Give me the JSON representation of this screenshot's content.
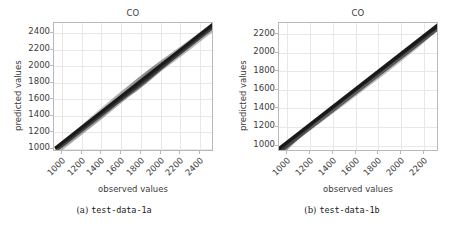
{
  "figure": {
    "panels": [
      {
        "id": "panel-a",
        "caption_index": "(a)",
        "caption_text": "test-data-1a",
        "chart_data": {
          "type": "scatter",
          "title": "CO",
          "xlabel": "observed values",
          "ylabel": "predicted values",
          "xticks": [
            1000,
            1200,
            1400,
            1600,
            1800,
            2000,
            2200,
            2400
          ],
          "yticks": [
            1000,
            1200,
            1400,
            1600,
            1800,
            2000,
            2200,
            2400
          ],
          "xlim": [
            920,
            2540
          ],
          "ylim": [
            960,
            2520
          ],
          "grid": true,
          "legend": null,
          "series": [
            {
              "name": "observed vs predicted",
              "color": "#1a1a1a",
              "description": "dense near-diagonal point cloud following y = x, widening into a gray fan between roughly x=1650 and x=2050",
              "x": [
                1040,
                1100,
                1160,
                1220,
                1280,
                1340,
                1400,
                1460,
                1520,
                1580,
                1640,
                1700,
                1760,
                1820,
                1880,
                1940,
                2000,
                2060,
                2120,
                2180,
                2240,
                2300,
                2360,
                2420,
                2480
              ],
              "y": [
                1060,
                1115,
                1170,
                1230,
                1290,
                1350,
                1410,
                1468,
                1528,
                1588,
                1650,
                1712,
                1775,
                1838,
                1898,
                1955,
                2012,
                2070,
                2130,
                2190,
                2250,
                2310,
                2368,
                2428,
                2490
              ],
              "spread_low": [
                1045,
                1098,
                1152,
                1208,
                1265,
                1322,
                1380,
                1436,
                1492,
                1546,
                1600,
                1652,
                1706,
                1760,
                1818,
                1878,
                1940,
                2002,
                2066,
                2130,
                2196,
                2260,
                2324,
                2388,
                2452
              ],
              "spread_high": [
                1075,
                1132,
                1190,
                1250,
                1312,
                1374,
                1436,
                1496,
                1556,
                1616,
                1678,
                1748,
                1820,
                1890,
                1952,
                2004,
                2052,
                2104,
                2158,
                2212,
                2268,
                2324,
                2382,
                2442,
                2502
              ]
            }
          ]
        }
      },
      {
        "id": "panel-b",
        "caption_index": "(b)",
        "caption_text": "test-data-1b",
        "chart_data": {
          "type": "scatter",
          "title": "CO",
          "xlabel": "observed values",
          "ylabel": "predicted values",
          "xticks": [
            1000,
            1200,
            1400,
            1600,
            1800,
            2000,
            2200
          ],
          "yticks": [
            1000,
            1200,
            1400,
            1600,
            1800,
            2000,
            2200
          ],
          "xlim": [
            930,
            2330
          ],
          "ylim": [
            930,
            2320
          ],
          "grid": true,
          "legend": null,
          "series": [
            {
              "name": "observed vs predicted",
              "color": "#1a1a1a",
              "description": "tight near-diagonal point cloud following y = x, with a modest gray spread below the line between x=980 and x=1250",
              "x": [
                980,
                1040,
                1100,
                1160,
                1220,
                1280,
                1340,
                1400,
                1460,
                1520,
                1580,
                1640,
                1700,
                1760,
                1820,
                1880,
                1940,
                2000,
                2060,
                2120,
                2180,
                2240,
                2280
              ],
              "y": [
                985,
                1045,
                1105,
                1165,
                1225,
                1285,
                1345,
                1405,
                1465,
                1525,
                1585,
                1645,
                1705,
                1765,
                1825,
                1885,
                1945,
                2005,
                2065,
                2125,
                2185,
                2245,
                2285
              ],
              "spread_low": [
                965,
                1000,
                1040,
                1090,
                1150,
                1215,
                1280,
                1344,
                1408,
                1470,
                1534,
                1598,
                1662,
                1726,
                1790,
                1852,
                1914,
                1976,
                2038,
                2100,
                2162,
                2224,
                2266
              ],
              "spread_high": [
                995,
                1058,
                1120,
                1180,
                1240,
                1300,
                1360,
                1420,
                1480,
                1540,
                1600,
                1660,
                1720,
                1780,
                1840,
                1900,
                1960,
                2020,
                2080,
                2140,
                2200,
                2258,
                2296
              ]
            }
          ]
        }
      }
    ],
    "colors": {
      "background": "#ffffff",
      "axis": "#b9b9b9",
      "grid": "#e8e8e8",
      "text": "#3b3b3b",
      "data": "#1a1a1a",
      "data_spread": "#8c8c8c"
    }
  }
}
